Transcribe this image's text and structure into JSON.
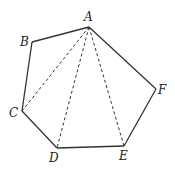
{
  "diagram": {
    "vertices": [
      {
        "id": "A",
        "x": 89,
        "y": 27,
        "label": "A",
        "lx": 84,
        "ly": 21
      },
      {
        "id": "B",
        "x": 32,
        "y": 42,
        "label": "B",
        "lx": 20,
        "ly": 46
      },
      {
        "id": "C",
        "x": 22,
        "y": 111,
        "label": "C",
        "lx": 9,
        "ly": 117
      },
      {
        "id": "D",
        "x": 57,
        "y": 148,
        "label": "D",
        "lx": 49,
        "ly": 162
      },
      {
        "id": "E",
        "x": 124,
        "y": 146,
        "label": "E",
        "lx": 119,
        "ly": 160
      },
      {
        "id": "F",
        "x": 156,
        "y": 89,
        "label": "F",
        "lx": 158,
        "ly": 94
      }
    ],
    "edges": [
      [
        "A",
        "B"
      ],
      [
        "B",
        "C"
      ],
      [
        "C",
        "D"
      ],
      [
        "D",
        "E"
      ],
      [
        "E",
        "F"
      ],
      [
        "F",
        "A"
      ]
    ],
    "diagonals": [
      [
        "A",
        "C"
      ],
      [
        "A",
        "D"
      ],
      [
        "A",
        "E"
      ]
    ],
    "colors": {
      "stroke": "#333333",
      "label": "#222222"
    }
  }
}
